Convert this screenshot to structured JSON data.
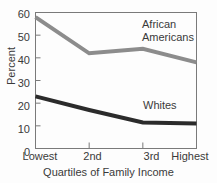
{
  "chart_data": {
    "type": "line",
    "title": "",
    "xlabel": "Quartiles of Family Income",
    "ylabel": "Percent",
    "categories": [
      "Lowest",
      "2nd",
      "3rd",
      "Highest"
    ],
    "ylim": [
      0,
      60
    ],
    "yticks": [
      0,
      10,
      20,
      30,
      40,
      50,
      60
    ],
    "ytick_labels": [
      "0",
      "10",
      "20",
      "30",
      "40",
      "50",
      "60"
    ],
    "grid": false,
    "legend_position": "inline-annotation",
    "series": [
      {
        "name": "African Americans",
        "label_line1": "African",
        "label_line2": "Americans",
        "color": "#8c8c8c",
        "values": [
          58,
          42,
          44,
          38
        ]
      },
      {
        "name": "Whites",
        "label_line1": "Whites",
        "label_line2": "",
        "color": "#2b2b2b",
        "values": [
          23,
          17,
          11.5,
          11
        ]
      }
    ]
  },
  "axis": {
    "ytick_0": "0",
    "ytick_10": "10",
    "ytick_20": "20",
    "ytick_30": "30",
    "ytick_40": "40",
    "ytick_50": "50",
    "ytick_60": "60",
    "xtick_0": "Lowest",
    "xtick_1": "2nd",
    "xtick_2": "3rd",
    "xtick_3": "Highest",
    "x_title": "Quartiles of Family Income",
    "y_title": "Percent"
  },
  "annotations": {
    "african_americans_line1": "African",
    "african_americans_line2": "Americans",
    "whites": "Whites",
    "clipped_top_title": ""
  }
}
